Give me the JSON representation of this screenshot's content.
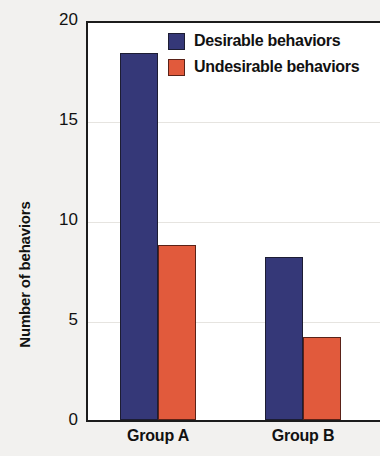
{
  "chart_data": {
    "type": "bar",
    "title": "",
    "xlabel": "",
    "ylabel": "Number of behaviors",
    "categories": [
      "Group A",
      "Group B"
    ],
    "series": [
      {
        "name": "Desirable behaviors",
        "color": "#353878",
        "values": [
          18.5,
          8.2
        ]
      },
      {
        "name": "Undesirable behaviors",
        "color": "#e15a3c",
        "values": [
          8.8,
          4.2
        ]
      }
    ],
    "ylim": [
      0,
      20
    ],
    "yticks": [
      0,
      5,
      10,
      15,
      20
    ],
    "ytick_labels": [
      "0",
      "5",
      "10",
      "15",
      "20"
    ],
    "grid": true,
    "legend_position": "top-right-inside"
  },
  "axes": {
    "y_title": "Number of behaviors",
    "y_tick_labels": [
      "20",
      "15",
      "10",
      "5",
      "0"
    ],
    "x_tick_labels": [
      "Group A",
      "Group B"
    ]
  },
  "legend": {
    "entries": [
      {
        "label": "Desirable behaviors",
        "swatch": "desirable-swatch"
      },
      {
        "label": "Undesirable behaviors",
        "swatch": "undesirable-swatch"
      }
    ]
  }
}
